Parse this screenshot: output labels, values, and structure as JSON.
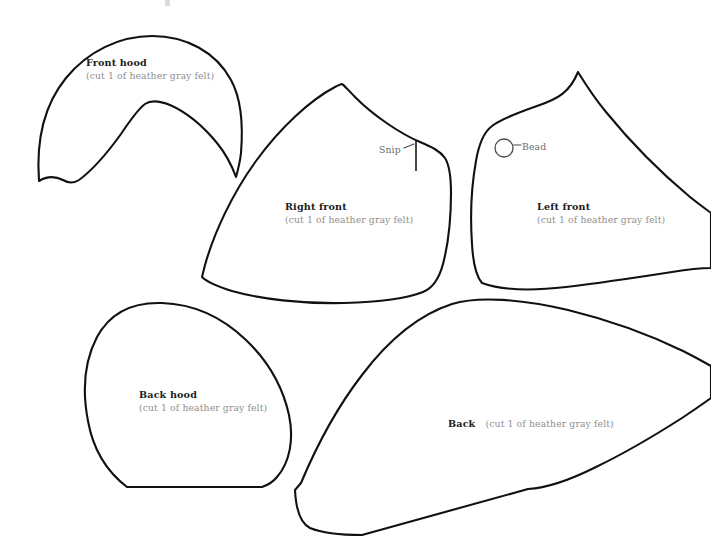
{
  "sheet": {
    "title": "Hooded garment felt pattern sheet",
    "background_color": "#ffffff",
    "outline_color": "#111111",
    "title_text_color": "#1b1b1b",
    "sub_text_color": "#8f8f8f",
    "marker_text_color": "#6a6a6a",
    "width": 711,
    "height": 550
  },
  "cut_instruction": "(cut 1 of heather gray felt)",
  "pieces": [
    {
      "id": "front-hood",
      "title": "Front hood",
      "sub": "(cut 1 of heather gray felt)",
      "label_x": 86,
      "label_y": 57,
      "inline": false
    },
    {
      "id": "right-front",
      "title": "Right front",
      "sub": "(cut 1 of heather gray felt)",
      "label_x": 285,
      "label_y": 201,
      "inline": false
    },
    {
      "id": "left-front",
      "title": "Left front",
      "sub": "(cut 1 of heather gray felt)",
      "label_x": 537,
      "label_y": 201,
      "inline": false
    },
    {
      "id": "back-hood",
      "title": "Back hood",
      "sub": "(cut 1 of heather gray felt)",
      "label_x": 139,
      "label_y": 389,
      "inline": false
    },
    {
      "id": "back",
      "title": "Back",
      "sub": "(cut 1 of heather gray felt)",
      "label_x": 448,
      "label_y": 411,
      "inline": true
    }
  ],
  "markers": [
    {
      "id": "snip",
      "label": "Snip",
      "label_x": 379,
      "label_y": 144,
      "on_piece": "right-front"
    },
    {
      "id": "bead",
      "label": "Bead",
      "label_x": 522,
      "label_y": 141,
      "on_piece": "left-front"
    }
  ]
}
